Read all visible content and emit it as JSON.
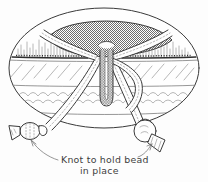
{
  "figure": {
    "caption_line_1": "Knot to hold bead",
    "caption_line_2": "in place",
    "caption_full": "Knot to hold bead in place"
  },
  "colors": {
    "ink": "#3a3a3a",
    "ink_light": "#7d7d7d",
    "halftone": "#808080",
    "background": "#fdfdfd",
    "paper": "#fefefe"
  },
  "parts": [
    {
      "id": "bag-body",
      "label": "bag-body-ellipse"
    },
    {
      "id": "top-panel",
      "label": "shaded-top-panel"
    },
    {
      "id": "fringe-band",
      "label": "fringe-texture-band"
    },
    {
      "id": "hatch-band",
      "label": "diagonal-hatch-band"
    },
    {
      "id": "scallop-band",
      "label": "scalloped-trim-band"
    },
    {
      "id": "drawcord",
      "label": "drawstring-cord"
    },
    {
      "id": "center-loop",
      "label": "center-cord-loop"
    },
    {
      "id": "left-bead",
      "label": "left-bead"
    },
    {
      "id": "right-bead",
      "label": "right-bead"
    },
    {
      "id": "left-tassel",
      "label": "left-cord-end-tassel"
    },
    {
      "id": "right-tassel",
      "label": "right-cord-end-tassel"
    },
    {
      "id": "left-pointer",
      "label": "left-caption-arrow"
    },
    {
      "id": "right-pointer",
      "label": "right-caption-arrow"
    }
  ]
}
